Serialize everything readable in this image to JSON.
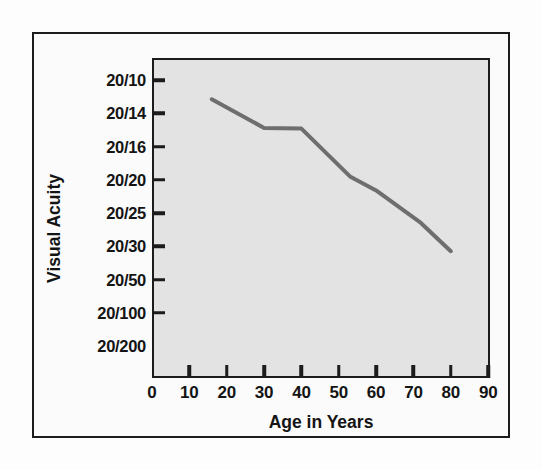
{
  "chart_data": {
    "type": "line",
    "title": "",
    "xlabel": "Age in Years",
    "ylabel": "Visual Acuity",
    "x_ticks": [
      "0",
      "10",
      "20",
      "30",
      "40",
      "50",
      "60",
      "70",
      "80",
      "90"
    ],
    "x_tick_values": [
      0,
      10,
      20,
      30,
      40,
      50,
      60,
      70,
      80,
      90
    ],
    "xlim": [
      0,
      92
    ],
    "y_ticks": [
      "20/10",
      "20/14",
      "20/16",
      "20/20",
      "20/25",
      "20/30",
      "20/50",
      "20/100",
      "20/200"
    ],
    "y_tick_index": [
      0,
      1,
      2,
      3,
      4,
      5,
      6,
      7,
      8
    ],
    "ylim_index": [
      -0.65,
      9.0
    ],
    "grid": false,
    "legend": false,
    "series": [
      {
        "name": "Visual acuity vs age",
        "color": "#6e6e6e",
        "line_width": 4,
        "x": [
          16,
          30,
          40,
          53,
          60,
          72,
          80
        ],
        "y_acuity": [
          "20/12",
          "20/15",
          "20/15",
          "20/21",
          "20/23",
          "20/27",
          "20/32"
        ],
        "y_index": [
          0.58,
          1.44,
          1.46,
          2.9,
          3.32,
          4.3,
          5.15
        ]
      }
    ]
  },
  "axes": {
    "x_title": "Age in Years",
    "y_title": "Visual Acuity"
  },
  "colors": {
    "panel_background": "#e3e3e3",
    "frame": "#1c1c1c",
    "line": "#6e6e6e",
    "page_background": "#fdfdfd",
    "text": "#141414"
  }
}
